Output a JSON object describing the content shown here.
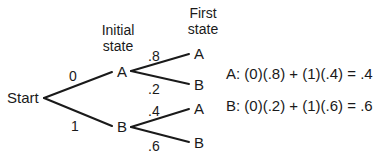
{
  "headers": {
    "initial": [
      "Initial",
      "state"
    ],
    "first": [
      "First",
      "state"
    ]
  },
  "nodes": {
    "start": "Start",
    "initial_a": "A",
    "initial_b": "B",
    "first_aa": "A",
    "first_ab": "B",
    "first_ba": "A",
    "first_bb": "B"
  },
  "edges": {
    "start_to_a": "0",
    "start_to_b": "1",
    "a_to_a": ".8",
    "a_to_b": ".2",
    "b_to_a": ".4",
    "b_to_b": ".6"
  },
  "equations": {
    "a": "A:  (0)(.8) + (1)(.4) = .4",
    "b": "B:  (0)(.2) + (1)(.6) = .6"
  },
  "colors": {
    "line": "#1a1a1a",
    "text": "#1a1a1a",
    "background": "#ffffff"
  }
}
